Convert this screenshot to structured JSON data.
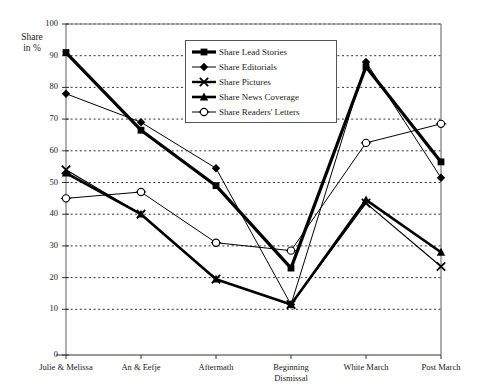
{
  "chart_data": {
    "type": "line",
    "title": "",
    "ylabel": "Share\nin %",
    "xlabel": "",
    "ylim": [
      0,
      100
    ],
    "yticks": [
      0,
      10,
      20,
      30,
      40,
      50,
      60,
      70,
      80,
      90,
      100
    ],
    "grid": true,
    "legend_position": "top-center-inside",
    "categories": [
      "Julie & Melissa",
      "An & Eefje",
      "Aftermath",
      "Beginning\nDismissal",
      "White March",
      "Post March"
    ],
    "series": [
      {
        "name": "Share Lead Stories",
        "marker": "square",
        "color": "#000000",
        "width": 3.2,
        "values": [
          91,
          66.5,
          49,
          23,
          86.5,
          56.5
        ]
      },
      {
        "name": "Share Editorials",
        "marker": "diamond",
        "color": "#000000",
        "width": 1,
        "values": [
          78,
          69,
          54.5,
          11.5,
          88,
          51.5
        ]
      },
      {
        "name": "Share Pictures",
        "marker": "x",
        "color": "#000000",
        "width": 1.2,
        "values": [
          54,
          40,
          19.5,
          11.5,
          43.5,
          23.5
        ]
      },
      {
        "name": "Share News Coverage",
        "marker": "triangle",
        "color": "#000000",
        "width": 2.6,
        "values": [
          53,
          40,
          19.5,
          11.5,
          44.5,
          28
        ]
      },
      {
        "name": "Share Readers' Letters",
        "marker": "circle",
        "color": "#000000",
        "width": 1,
        "values": [
          45,
          47,
          31,
          28.5,
          62.5,
          68.5
        ]
      }
    ]
  },
  "legend": {
    "items": [
      {
        "label": "Share Lead Stories"
      },
      {
        "label": "Share Editorials"
      },
      {
        "label": "Share Pictures"
      },
      {
        "label": "Share News Coverage"
      },
      {
        "label": "Share Readers' Letters"
      }
    ]
  }
}
